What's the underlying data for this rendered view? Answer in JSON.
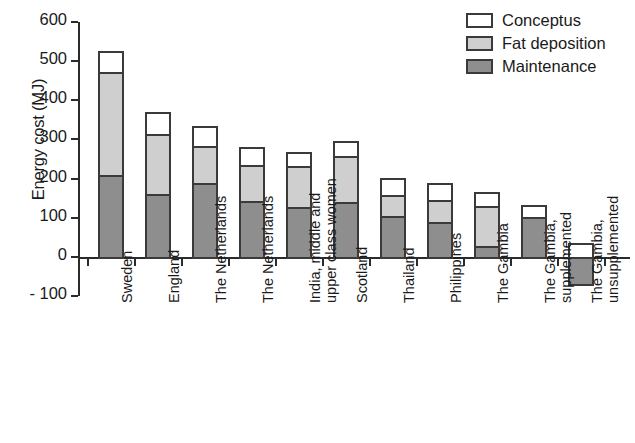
{
  "chart_data": {
    "type": "bar",
    "subtype": "stacked-bar",
    "title": "",
    "xlabel": "",
    "ylabel": "Energy cost (MJ)",
    "ylim": [
      -100,
      600
    ],
    "yticks": [
      600,
      500,
      400,
      300,
      200,
      100,
      0,
      -100
    ],
    "ytick_labels": [
      "600",
      "500",
      "400",
      "300",
      "200",
      "100",
      "0",
      "- 100"
    ],
    "grid": false,
    "legend_position": "top-right",
    "categories": [
      "Sweden",
      "England",
      "The Netherlands",
      "The Netherlands",
      "India, middle and\nupper class women",
      "Scotland",
      "Thailand",
      "Philippines",
      "The Gambia",
      "The Gambia,\nsupplemented",
      "The Gambia,\nunsupplemented"
    ],
    "series": [
      {
        "name": "Maintenance",
        "color": "#8e8e8e",
        "values": [
          210,
          160,
          188,
          142,
          128,
          140,
          105,
          88,
          27,
          103,
          -70
        ]
      },
      {
        "name": "Fat deposition",
        "color": "#cfcfcf",
        "values": [
          263,
          155,
          95,
          93,
          103,
          118,
          52,
          57,
          103,
          0,
          0
        ]
      },
      {
        "name": "Conceptus",
        "color": "#ffffff",
        "values": [
          52,
          55,
          52,
          45,
          38,
          37,
          45,
          44,
          35,
          29,
          36
        ]
      }
    ],
    "totals": [
      525,
      370,
      335,
      280,
      269,
      295,
      202,
      189,
      165,
      132,
      36
    ]
  },
  "axis": {
    "y_title": "Energy cost (MJ)",
    "ticks": [
      {
        "label": "600",
        "value": 600
      },
      {
        "label": "500",
        "value": 500
      },
      {
        "label": "400",
        "value": 400
      },
      {
        "label": "300",
        "value": 300
      },
      {
        "label": "200",
        "value": 200
      },
      {
        "label": "100",
        "value": 100
      },
      {
        "label": "0",
        "value": 0
      },
      {
        "label": "- 100",
        "value": -100
      }
    ]
  },
  "legend": {
    "items": [
      {
        "label": "Conceptus",
        "key": "conceptus"
      },
      {
        "label": "Fat deposition",
        "key": "fat"
      },
      {
        "label": "Maintenance",
        "key": "maintenance"
      }
    ]
  },
  "categories": [
    {
      "line1": "Sweden",
      "line2": ""
    },
    {
      "line1": "England",
      "line2": ""
    },
    {
      "line1": "The Netherlands",
      "line2": ""
    },
    {
      "line1": "The Netherlands",
      "line2": ""
    },
    {
      "line1": "India, middle and",
      "line2": "upper class women"
    },
    {
      "line1": "Scotland",
      "line2": ""
    },
    {
      "line1": "Thailand",
      "line2": ""
    },
    {
      "line1": "Philippines",
      "line2": ""
    },
    {
      "line1": "The Gambia",
      "line2": ""
    },
    {
      "line1": "The Gambia,",
      "line2": "supplemented"
    },
    {
      "line1": "The Gambia,",
      "line2": "unsupplemented"
    }
  ],
  "colors": {
    "conceptus": "#ffffff",
    "fat_deposition": "#cfcfcf",
    "maintenance": "#8e8e8e",
    "outline": "#3a3a3a",
    "axis": "#2b2b2b"
  }
}
